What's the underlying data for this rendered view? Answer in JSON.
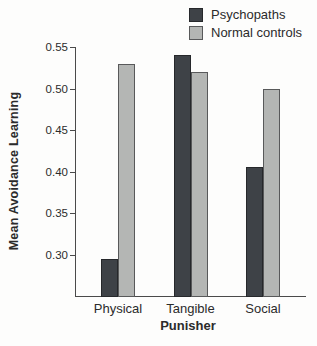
{
  "chart_data": {
    "type": "bar",
    "title": "",
    "xlabel": "Punisher",
    "ylabel": "Mean Avoidance Learning",
    "categories": [
      "Physical",
      "Tangible",
      "Social"
    ],
    "series": [
      {
        "name": "Psychopaths",
        "color": "#3e4247",
        "border": "#26282b",
        "values": [
          0.295,
          0.54,
          0.405
        ]
      },
      {
        "name": "Normal controls",
        "color": "#b4b6b4",
        "border": "#58595a",
        "values": [
          0.53,
          0.52,
          0.5
        ]
      }
    ],
    "ylim": [
      0.25,
      0.55
    ],
    "yticks": [
      0.3,
      0.35,
      0.4,
      0.45,
      0.5,
      0.55
    ],
    "ytick_labels": [
      "0.30",
      "0.35",
      "0.40",
      "0.45",
      "0.50",
      "0.55"
    ],
    "grid": false,
    "legend_position": "top-right",
    "background": "#fdfdfc"
  }
}
